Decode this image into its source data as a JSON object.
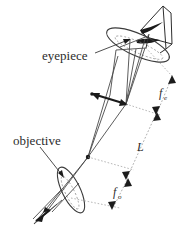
{
  "figure": {
    "background_color": "#ffffff",
    "ink_color": "#2b2b2b",
    "width": 193,
    "height": 234
  },
  "labels": {
    "eyepiece": "eyepiece",
    "objective": "objective",
    "tube_length": "L",
    "focal_eyepiece": "f",
    "focal_eyepiece_sub": "e",
    "focal_objective": "f",
    "focal_objective_sub": "o"
  },
  "components": [
    {
      "name": "eye",
      "label": "eye"
    },
    {
      "name": "eyepiece-lens",
      "label": "eyepiece"
    },
    {
      "name": "intermediate-image-arrow",
      "label": "intermediate image"
    },
    {
      "name": "objective-lens",
      "label": "objective"
    },
    {
      "name": "object-arrow",
      "label": "object"
    }
  ],
  "dimensions": [
    {
      "name": "f_e",
      "symbol": "f",
      "subscript": "e",
      "description": "eyepiece focal length"
    },
    {
      "name": "L",
      "symbol": "L",
      "subscript": "",
      "description": "tube length"
    },
    {
      "name": "f_o",
      "symbol": "f",
      "subscript": "o",
      "description": "objective focal length"
    }
  ]
}
